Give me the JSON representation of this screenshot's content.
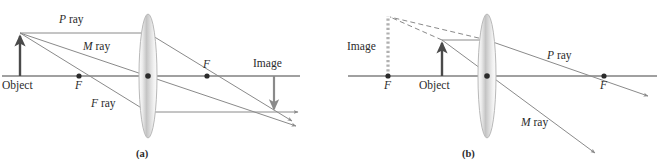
{
  "figure": {
    "panels": [
      {
        "id": "a",
        "caption": "(a)",
        "description": "Real inverted image formed by a converging lens with object outside the focal point",
        "labels": {
          "object": "Object",
          "image": "Image",
          "p_ray": "P ray",
          "m_ray": "M ray",
          "f_ray": "F ray",
          "focal_left": "F",
          "focal_right": "F",
          "focal_near_object": "F"
        }
      },
      {
        "id": "b",
        "caption": "(b)",
        "description": "Virtual upright magnified image formed by a converging lens with object inside the focal point",
        "labels": {
          "object": "Object",
          "image": "Image",
          "p_ray": "P ray",
          "m_ray": "M ray",
          "focal_left": "F",
          "focal_right": "F"
        }
      }
    ]
  },
  "colors": {
    "axis": "#808080",
    "ray": "#8a8a8a",
    "object_arrow": "#4a4a4a",
    "image_arrow": "#8a8a8a",
    "virtual_image": "#b0b0b0",
    "lens_edge": "#b9b9b9",
    "lens_fill_light": "#fdfdfd",
    "lens_fill_mid": "#c9c9c9",
    "dot": "#2b2b2b",
    "text": "#2b2b2b",
    "background": "#ffffff"
  },
  "geometry": {
    "panel_a": {
      "axis_y": 76,
      "axis_x_start": 2,
      "axis_x_end": 300,
      "lens_x": 148,
      "lens_ry": 62,
      "lens_rx": 9,
      "object_x": 20,
      "object_top_y": 33,
      "focal_left_x": 79,
      "focal_right_x": 207,
      "image_x": 274,
      "image_bottom_y": 112,
      "converge_x": 274,
      "converge_y": 112
    },
    "panel_b": {
      "axis_y": 76,
      "axis_x_start": 348,
      "axis_x_end": 657,
      "lens_x": 487,
      "lens_ry": 62,
      "lens_rx": 9,
      "object_x": 442,
      "object_top_y": 40,
      "focal_left_x": 388,
      "focal_right_x": 604,
      "virtual_image_x": 388,
      "virtual_image_top_y": 16
    }
  }
}
